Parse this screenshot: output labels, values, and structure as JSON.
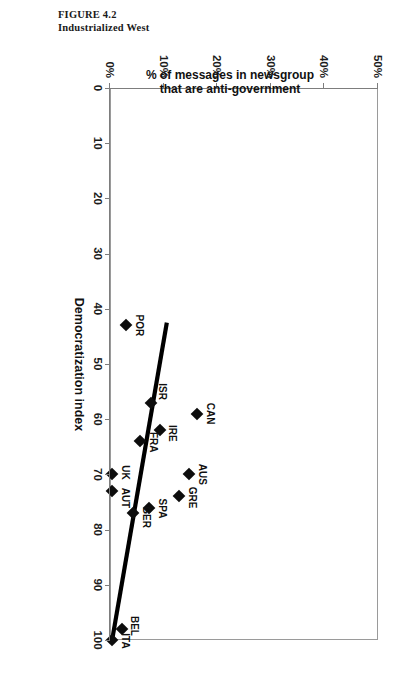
{
  "figure": {
    "number_label": "FIGURE 4.2",
    "caption": "Industrialized West"
  },
  "chart_data": {
    "type": "scatter",
    "title": "Industrialized West",
    "xlabel": "Democratization index",
    "ylabel": "% of messages in newsgroup that are anti-government",
    "ylabel_line1": "% of messages in newsgroup",
    "ylabel_line2": "that are anti-government",
    "xlim": [
      0,
      100
    ],
    "ylim": [
      0,
      50
    ],
    "xticks": [
      0,
      10,
      20,
      30,
      40,
      50,
      60,
      70,
      80,
      90,
      100
    ],
    "xtick_labels": [
      "0",
      "10",
      "20",
      "30",
      "40",
      "50",
      "60",
      "70",
      "80",
      "90",
      "100"
    ],
    "yticks": [
      0,
      10,
      20,
      30,
      40,
      50
    ],
    "ytick_labels": [
      "0%",
      "10%",
      "20%",
      "30%",
      "40%",
      "50%"
    ],
    "grid": false,
    "legend": "none",
    "points": [
      {
        "label": "POR",
        "x": 43,
        "y": 3.0,
        "label_dx": 0,
        "label_dy": -13
      },
      {
        "label": "ISR",
        "x": 57,
        "y": 7.6,
        "label_dx": -11,
        "label_dy": -11
      },
      {
        "label": "CAN",
        "x": 59,
        "y": 16.3,
        "label_dx": 0,
        "label_dy": -13
      },
      {
        "label": "IRE",
        "x": 62,
        "y": 9.3,
        "label_dx": 3,
        "label_dy": -12
      },
      {
        "label": "FRA",
        "x": 64,
        "y": 5.6,
        "label_dx": 1,
        "label_dy": -13
      },
      {
        "label": "UK",
        "x": 70,
        "y": 0.4,
        "label_dx": -2,
        "label_dy": -13
      },
      {
        "label": "AUS",
        "x": 70,
        "y": 14.8,
        "label_dx": 0,
        "label_dy": -13
      },
      {
        "label": "AUT",
        "x": 73,
        "y": 0.4,
        "label_dx": 7,
        "label_dy": -13
      },
      {
        "label": "GRE",
        "x": 74,
        "y": 12.8,
        "label_dx": 1,
        "label_dy": -13
      },
      {
        "label": "SPA",
        "x": 76,
        "y": 7.2,
        "label_dx": 1,
        "label_dy": -13
      },
      {
        "label": "GER",
        "x": 77,
        "y": 4.2,
        "label_dx": 4,
        "label_dy": -13
      },
      {
        "label": "BEL",
        "x": 98,
        "y": 2.2,
        "label_dx": -3,
        "label_dy": -12
      },
      {
        "label": "ITA",
        "x": 100,
        "y": 0.4,
        "label_dx": 1,
        "label_dy": -13
      }
    ],
    "trendline": {
      "x0": 42.5,
      "y0": 10.6,
      "x1": 100.0,
      "y1": 0.4
    }
  }
}
